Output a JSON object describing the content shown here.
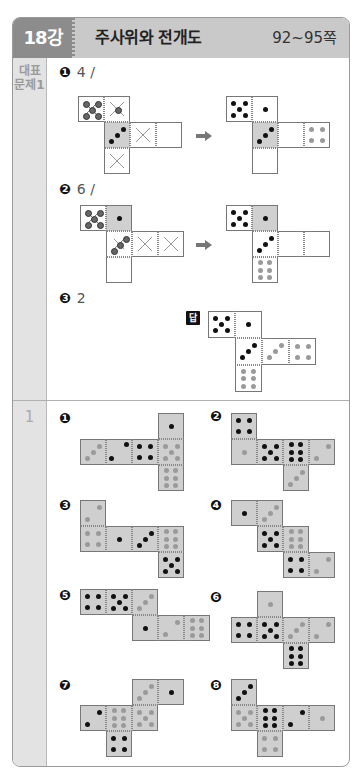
{
  "header": {
    "lesson": "18강",
    "title": "주사위와 전개도",
    "pages": "92~95쪽",
    "colors": {
      "lesson_bg": "#8c8c8c",
      "title_bg": "#c9c9c9"
    }
  },
  "sections": [
    {
      "label_line1": "대표",
      "label_line2": "문제1",
      "items": [
        {
          "badge": "1",
          "text": "4 /"
        },
        {
          "badge": "2",
          "text": "6 /"
        },
        {
          "badge": "3",
          "text": "2"
        }
      ],
      "answer_badge": "답"
    },
    {
      "label": "1",
      "items": [
        {
          "badge": "1"
        },
        {
          "badge": "2"
        },
        {
          "badge": "3"
        },
        {
          "badge": "4"
        },
        {
          "badge": "5"
        },
        {
          "badge": "6"
        },
        {
          "badge": "7"
        },
        {
          "badge": "8"
        }
      ]
    }
  ],
  "nets": [
    {
      "id": "rep1-q",
      "x": 78,
      "y": 96,
      "s": 26,
      "shade": false,
      "cells": [
        {
          "c": 0,
          "r": 0,
          "pips": "x5"
        },
        {
          "c": 1,
          "r": 0,
          "pips": "xc"
        },
        {
          "c": 1,
          "r": 1,
          "pips": "b3",
          "fill": "#d0d0d0"
        },
        {
          "c": 2,
          "r": 1,
          "pips": "xx"
        },
        {
          "c": 3,
          "r": 1,
          "pips": ""
        },
        {
          "c": 1,
          "r": 2,
          "pips": "xx"
        }
      ]
    },
    {
      "id": "rep1-a",
      "x": 226,
      "y": 96,
      "s": 26,
      "shade": false,
      "cells": [
        {
          "c": 0,
          "r": 0,
          "pips": "b5"
        },
        {
          "c": 1,
          "r": 0,
          "pips": "b1"
        },
        {
          "c": 1,
          "r": 1,
          "pips": "b3",
          "fill": "#d0d0d0"
        },
        {
          "c": 2,
          "r": 1,
          "pips": ""
        },
        {
          "c": 3,
          "r": 1,
          "pips": "g4"
        },
        {
          "c": 1,
          "r": 2,
          "pips": ""
        }
      ]
    },
    {
      "id": "rep2-q",
      "x": 80,
      "y": 205,
      "s": 26,
      "shade": false,
      "cells": [
        {
          "c": 0,
          "r": 0,
          "pips": "x5"
        },
        {
          "c": 1,
          "r": 0,
          "pips": "b1",
          "fill": "#d0d0d0"
        },
        {
          "c": 1,
          "r": 1,
          "pips": "x3"
        },
        {
          "c": 2,
          "r": 1,
          "pips": "xx"
        },
        {
          "c": 3,
          "r": 1,
          "pips": "xx"
        },
        {
          "c": 1,
          "r": 2,
          "pips": ""
        }
      ]
    },
    {
      "id": "rep2-a",
      "x": 226,
      "y": 205,
      "s": 26,
      "shade": false,
      "cells": [
        {
          "c": 0,
          "r": 0,
          "pips": "b5"
        },
        {
          "c": 1,
          "r": 0,
          "pips": "b1",
          "fill": "#d0d0d0"
        },
        {
          "c": 1,
          "r": 1,
          "pips": "b3"
        },
        {
          "c": 2,
          "r": 1,
          "pips": ""
        },
        {
          "c": 3,
          "r": 1,
          "pips": ""
        },
        {
          "c": 1,
          "r": 2,
          "pips": "g6"
        }
      ]
    },
    {
      "id": "rep3-a",
      "x": 208,
      "y": 311,
      "s": 27,
      "shade": false,
      "cells": [
        {
          "c": 0,
          "r": 0,
          "pips": "b5"
        },
        {
          "c": 1,
          "r": 0,
          "pips": "b1"
        },
        {
          "c": 1,
          "r": 1,
          "pips": "b3"
        },
        {
          "c": 2,
          "r": 1,
          "pips": "g3"
        },
        {
          "c": 3,
          "r": 1,
          "pips": "g4"
        },
        {
          "c": 1,
          "r": 2,
          "pips": "g6"
        }
      ]
    },
    {
      "id": "p1",
      "x": 80,
      "y": 413,
      "s": 26,
      "shade": true,
      "cells": [
        {
          "c": 3,
          "r": 0,
          "pips": "b1"
        },
        {
          "c": 0,
          "r": 1,
          "pips": "g3"
        },
        {
          "c": 1,
          "r": 1,
          "pips": "b2r"
        },
        {
          "c": 2,
          "r": 1,
          "pips": "b4"
        },
        {
          "c": 3,
          "r": 1,
          "pips": "g5"
        },
        {
          "c": 3,
          "r": 2,
          "pips": "g6"
        }
      ]
    },
    {
      "id": "p2",
      "x": 231,
      "y": 413,
      "s": 26,
      "shade": true,
      "cells": [
        {
          "c": 0,
          "r": 0,
          "pips": "b4"
        },
        {
          "c": 0,
          "r": 1,
          "pips": "g1"
        },
        {
          "c": 1,
          "r": 1,
          "pips": "b5"
        },
        {
          "c": 2,
          "r": 1,
          "pips": "b6"
        },
        {
          "c": 3,
          "r": 1,
          "pips": "g2"
        },
        {
          "c": 2,
          "r": 2,
          "pips": "g3"
        }
      ]
    },
    {
      "id": "p3",
      "x": 80,
      "y": 500,
      "s": 26,
      "shade": true,
      "cells": [
        {
          "c": 0,
          "r": 0,
          "pips": "g2"
        },
        {
          "c": 0,
          "r": 1,
          "pips": "g4"
        },
        {
          "c": 1,
          "r": 1,
          "pips": "b1"
        },
        {
          "c": 2,
          "r": 1,
          "pips": "b3"
        },
        {
          "c": 3,
          "r": 1,
          "pips": "g6"
        },
        {
          "c": 3,
          "r": 2,
          "pips": "b5"
        }
      ]
    },
    {
      "id": "p4",
      "x": 231,
      "y": 500,
      "s": 26,
      "shade": true,
      "cells": [
        {
          "c": 0,
          "r": 0,
          "pips": "b1"
        },
        {
          "c": 1,
          "r": 0,
          "pips": "g3"
        },
        {
          "c": 1,
          "r": 1,
          "pips": "b5"
        },
        {
          "c": 2,
          "r": 1,
          "pips": "g6"
        },
        {
          "c": 2,
          "r": 2,
          "pips": "b4"
        },
        {
          "c": 3,
          "r": 2,
          "pips": "g2"
        }
      ]
    },
    {
      "id": "p5",
      "x": 80,
      "y": 589,
      "s": 26,
      "shade": true,
      "cells": [
        {
          "c": 0,
          "r": 0,
          "pips": "b4"
        },
        {
          "c": 1,
          "r": 0,
          "pips": "b5"
        },
        {
          "c": 2,
          "r": 0,
          "pips": "g3"
        },
        {
          "c": 2,
          "r": 1,
          "pips": "b1"
        },
        {
          "c": 3,
          "r": 1,
          "pips": "g2"
        },
        {
          "c": 4,
          "r": 1,
          "pips": "g6"
        }
      ]
    },
    {
      "id": "p6",
      "x": 231,
      "y": 591,
      "s": 26,
      "shade": true,
      "cells": [
        {
          "c": 1,
          "r": 0,
          "pips": "g1"
        },
        {
          "c": 0,
          "r": 1,
          "pips": "b4"
        },
        {
          "c": 1,
          "r": 1,
          "pips": "b5"
        },
        {
          "c": 2,
          "r": 1,
          "pips": "g3"
        },
        {
          "c": 3,
          "r": 1,
          "pips": "g2"
        },
        {
          "c": 2,
          "r": 2,
          "pips": "b6"
        }
      ]
    },
    {
      "id": "p7",
      "x": 80,
      "y": 679,
      "s": 26,
      "shade": true,
      "cells": [
        {
          "c": 2,
          "r": 0,
          "pips": "g3"
        },
        {
          "c": 3,
          "r": 0,
          "pips": "b1"
        },
        {
          "c": 0,
          "r": 1,
          "pips": "b2"
        },
        {
          "c": 1,
          "r": 1,
          "pips": "g6"
        },
        {
          "c": 2,
          "r": 1,
          "pips": "g5"
        },
        {
          "c": 1,
          "r": 2,
          "pips": "b4"
        }
      ]
    },
    {
      "id": "p8",
      "x": 231,
      "y": 679,
      "s": 26,
      "shade": true,
      "cells": [
        {
          "c": 0,
          "r": 0,
          "pips": "b3"
        },
        {
          "c": 0,
          "r": 1,
          "pips": "g5"
        },
        {
          "c": 1,
          "r": 1,
          "pips": "b6"
        },
        {
          "c": 2,
          "r": 1,
          "pips": "b2"
        },
        {
          "c": 3,
          "r": 1,
          "pips": "g1"
        },
        {
          "c": 1,
          "r": 2,
          "pips": "g4"
        }
      ]
    }
  ],
  "arrows": [
    {
      "x": 196,
      "y": 131
    },
    {
      "x": 196,
      "y": 240
    }
  ]
}
